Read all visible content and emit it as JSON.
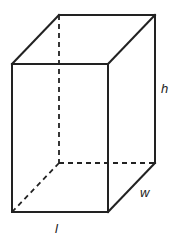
{
  "figure": {
    "type": "rectangular prism",
    "labels": {
      "height": "h",
      "width": "w",
      "length": "l"
    },
    "colors": {
      "line": "#222222",
      "background": "#ffffff"
    }
  }
}
